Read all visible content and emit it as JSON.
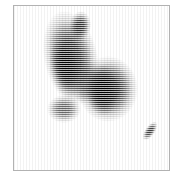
{
  "viewer": {
    "width": 184,
    "height": 180,
    "background_color": "#ffffff",
    "frame_color": "#b2b2b2",
    "frame_left": 13,
    "frame_top": 5,
    "frame_width": 157,
    "frame_height": 166,
    "render_style": "horizontal-halftone-scanlines",
    "scanline_period_px": 2,
    "colormap": "grayscale-inverted"
  },
  "chart_data": {
    "type": "heatmap",
    "title": "",
    "xlabel": "",
    "ylabel": "",
    "grid": false,
    "legend": "none",
    "xlim": [
      0,
      157
    ],
    "ylim": [
      0,
      166
    ],
    "colormap": "gray_r",
    "value_range": [
      0.0,
      1.0
    ],
    "background_value": 0.0,
    "sources": [
      {
        "name": "upper-left-elongated-blob",
        "cx": 57,
        "cy": 52,
        "rx": 27,
        "ry": 48,
        "rotation_deg": -12,
        "peak_intensity": 0.88,
        "falloff": "gaussian"
      },
      {
        "name": "upper-left-blob-core",
        "cx": 52,
        "cy": 62,
        "rx": 16,
        "ry": 30,
        "rotation_deg": -10,
        "peak_intensity": 0.96,
        "falloff": "gaussian"
      },
      {
        "name": "upper-spur",
        "cx": 66,
        "cy": 20,
        "rx": 11,
        "ry": 15,
        "rotation_deg": 8,
        "peak_intensity": 0.8,
        "falloff": "gaussian"
      },
      {
        "name": "lower-right-round-blob",
        "cx": 94,
        "cy": 83,
        "rx": 30,
        "ry": 33,
        "rotation_deg": 0,
        "peak_intensity": 0.92,
        "falloff": "gaussian"
      },
      {
        "name": "lower-right-blob-core",
        "cx": 88,
        "cy": 84,
        "rx": 16,
        "ry": 26,
        "rotation_deg": -4,
        "peak_intensity": 1.0,
        "falloff": "gaussian"
      },
      {
        "name": "bridge-between-blobs",
        "cx": 72,
        "cy": 76,
        "rx": 16,
        "ry": 22,
        "rotation_deg": 0,
        "peak_intensity": 0.55,
        "falloff": "gaussian"
      },
      {
        "name": "lower-left-tail",
        "cx": 50,
        "cy": 103,
        "rx": 17,
        "ry": 14,
        "rotation_deg": 0,
        "peak_intensity": 0.62,
        "falloff": "gaussian"
      },
      {
        "name": "faint-companion-streak",
        "cx": 136,
        "cy": 125,
        "rx": 5,
        "ry": 11,
        "rotation_deg": 35,
        "peak_intensity": 0.78,
        "falloff": "gaussian"
      }
    ]
  }
}
